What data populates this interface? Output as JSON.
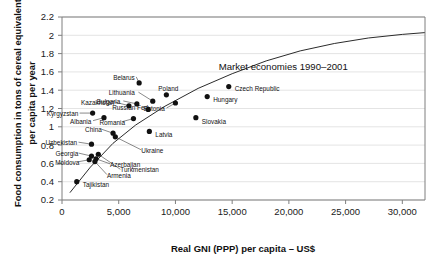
{
  "chart_data": {
    "type": "scatter",
    "title": "",
    "xlabel": "Real GNI (PPP) per capita – US$",
    "ylabel": "Food consumption in tons of cereal equivalent per capita per year",
    "xlim": [
      0,
      32000
    ],
    "ylim": [
      0.2,
      2.2
    ],
    "grid": true,
    "legend": "none",
    "xticks": [
      0,
      5000,
      10000,
      15000,
      20000,
      25000,
      30000
    ],
    "xtick_labels": [
      "0",
      "5,000",
      "10,000",
      "15,000",
      "20,000",
      "25,000",
      "30,000"
    ],
    "yticks": [
      0.2,
      0.4,
      0.6,
      0.8,
      1.0,
      1.2,
      1.4,
      1.6,
      1.8,
      2.0,
      2.2
    ],
    "ytick_labels": [
      "0.2",
      "0.4",
      "0.6",
      "0.8",
      "1",
      "1.2",
      "1.4",
      "1.6",
      "1.8",
      "2",
      "2.2"
    ],
    "annotations": [
      {
        "text": "Market economies 1990–2001",
        "x": 19500,
        "y": 1.62
      }
    ],
    "series": [
      {
        "name": "Transition economies",
        "marker": "filled-circle",
        "color": "#111111",
        "points": [
          {
            "label": "Belarus",
            "x": 6800,
            "y": 1.48,
            "label_dx": -26,
            "label_dy": -5
          },
          {
            "label": "Czech Republic",
            "x": 14700,
            "y": 1.44,
            "label_dx": 6,
            "label_dy": 2.5
          },
          {
            "label": "Poland",
            "x": 9200,
            "y": 1.35,
            "label_dx": -8,
            "label_dy": -6
          },
          {
            "label": "Hungary",
            "x": 12800,
            "y": 1.33,
            "label_dx": 6,
            "label_dy": 3
          },
          {
            "label": "Lithuania",
            "x": 8000,
            "y": 1.28,
            "label_dx": -44,
            "label_dy": -8
          },
          {
            "label": "Estonia",
            "x": 10000,
            "y": 1.26,
            "label_dx": -32,
            "label_dy": 6
          },
          {
            "label": "Bulgaria",
            "x": 6600,
            "y": 1.25,
            "label_dx": -40,
            "label_dy": -2
          },
          {
            "label": "Kazakhstan",
            "x": 5900,
            "y": 1.23,
            "label_dx": -48,
            "label_dy": -3
          },
          {
            "label": "Russian Fed",
            "x": 7600,
            "y": 1.19,
            "label_dx": -36,
            "label_dy": -2
          },
          {
            "label": "Kyrgyzstan",
            "x": 2700,
            "y": 1.15,
            "label_dx": -46,
            "label_dy": 1
          },
          {
            "label": "Slovakia",
            "x": 11800,
            "y": 1.1,
            "label_dx": 6,
            "label_dy": 4
          },
          {
            "label": "Albania",
            "x": 3700,
            "y": 1.1,
            "label_dx": -34,
            "label_dy": 4
          },
          {
            "label": "Romania",
            "x": 6300,
            "y": 1.09,
            "label_dx": -34,
            "label_dy": 4
          },
          {
            "label": "Latvia",
            "x": 7700,
            "y": 0.95,
            "label_dx": 6,
            "label_dy": 3
          },
          {
            "label": "China",
            "x": 4500,
            "y": 0.93,
            "label_dx": -28,
            "label_dy": -3
          },
          {
            "label": "Ukraine",
            "x": 4700,
            "y": 0.89,
            "label_dx": 26,
            "label_dy": 14
          },
          {
            "label": "Uzbekistan",
            "x": 2600,
            "y": 0.81,
            "label_dx": -46,
            "label_dy": -1
          },
          {
            "label": "Turkmenistan",
            "x": 3200,
            "y": 0.7,
            "label_dx": 22,
            "label_dy": 16
          },
          {
            "label": "Georgia",
            "x": 2600,
            "y": 0.68,
            "label_dx": -36,
            "label_dy": -2
          },
          {
            "label": "Azerbaijan",
            "x": 3000,
            "y": 0.65,
            "label_dx": 14,
            "label_dy": 6
          },
          {
            "label": "Moldova",
            "x": 2400,
            "y": 0.64,
            "label_dx": -34,
            "label_dy": 3
          },
          {
            "label": "Armenia",
            "x": 2900,
            "y": 0.62,
            "label_dx": 12,
            "label_dy": 14
          },
          {
            "label": "Tajikistan",
            "x": 1300,
            "y": 0.4,
            "label_dx": 6,
            "label_dy": 3
          }
        ]
      }
    ],
    "trend_curve": {
      "name": "Market economies 1990-2001",
      "description": "Concave rising curve through transition cluster",
      "points": [
        {
          "x": 700,
          "y": 0.28
        },
        {
          "x": 2500,
          "y": 0.56
        },
        {
          "x": 4500,
          "y": 0.82
        },
        {
          "x": 6500,
          "y": 1.02
        },
        {
          "x": 9000,
          "y": 1.22
        },
        {
          "x": 12000,
          "y": 1.42
        },
        {
          "x": 15000,
          "y": 1.58
        },
        {
          "x": 18000,
          "y": 1.72
        },
        {
          "x": 21000,
          "y": 1.83
        },
        {
          "x": 24000,
          "y": 1.91
        },
        {
          "x": 27000,
          "y": 1.97
        },
        {
          "x": 30000,
          "y": 2.01
        },
        {
          "x": 32000,
          "y": 2.03
        }
      ]
    }
  }
}
